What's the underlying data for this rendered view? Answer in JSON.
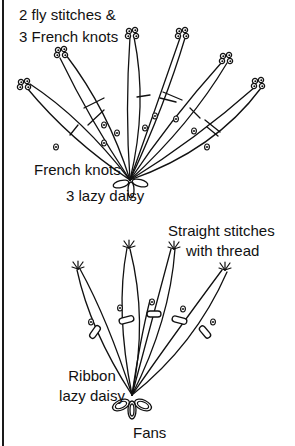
{
  "figure": {
    "top_fan": {
      "labels": {
        "fly_line1": "2 fly stitches &",
        "fly_line2": "3 French knots",
        "french_knots": "French knots",
        "lazy_daisy": "3 lazy daisy"
      }
    },
    "bottom_fan": {
      "labels": {
        "straight_line1": "Straight stitches",
        "straight_line2": "with thread",
        "ribbon_line1": "Ribbon",
        "ribbon_line2": "lazy daisy",
        "fans": "Fans"
      }
    },
    "colors": {
      "stroke": "#111111",
      "background": "#ffffff"
    }
  }
}
